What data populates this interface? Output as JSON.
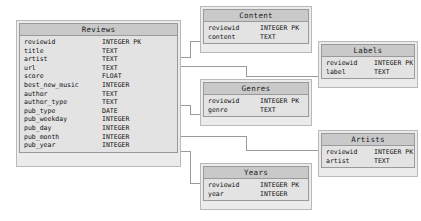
{
  "diagram": {
    "type": "entity-relationship-diagram",
    "background_color": "#ffffff",
    "entity_header_color": "#c9c9c9",
    "entity_body_color": "#e3e3e3",
    "entity_border_color": "#9a9a9a",
    "connector_color": "#9a9a9a"
  },
  "entities": [
    {
      "id": "reviews",
      "name": "Reviews",
      "fields": [
        {
          "name": "reviewid",
          "type": "INTEGER PK"
        },
        {
          "name": "title",
          "type": "TEXT"
        },
        {
          "name": "artist",
          "type": "TEXT"
        },
        {
          "name": "url",
          "type": "TEXT"
        },
        {
          "name": "score",
          "type": "FLOAT"
        },
        {
          "name": "best_new_music",
          "type": "INTEGER"
        },
        {
          "name": "author",
          "type": "TEXT"
        },
        {
          "name": "author_type",
          "type": "TEXT"
        },
        {
          "name": "pub_type",
          "type": "DATE"
        },
        {
          "name": "pub_weekday",
          "type": "INTEGER"
        },
        {
          "name": "pub_day",
          "type": "INTEGER"
        },
        {
          "name": "pub_month",
          "type": "INTEGER"
        },
        {
          "name": "pub_year",
          "type": "INTEGER"
        }
      ]
    },
    {
      "id": "content",
      "name": "Content",
      "fields": [
        {
          "name": "reviewid",
          "type": "INTEGER PK"
        },
        {
          "name": "content",
          "type": "TEXT"
        }
      ]
    },
    {
      "id": "labels",
      "name": "Labels",
      "fields": [
        {
          "name": "reviewid",
          "type": "INTEGER PK"
        },
        {
          "name": "label",
          "type": "TEXT"
        }
      ]
    },
    {
      "id": "genres",
      "name": "Genres",
      "fields": [
        {
          "name": "reviewid",
          "type": "INTEGER PK"
        },
        {
          "name": "genre",
          "type": "TEXT"
        }
      ]
    },
    {
      "id": "artists",
      "name": "Artists",
      "fields": [
        {
          "name": "reviewid",
          "type": "INTEGER PK"
        },
        {
          "name": "artist",
          "type": "TEXT"
        }
      ]
    },
    {
      "id": "years",
      "name": "Years",
      "fields": [
        {
          "name": "reviewid",
          "type": "INTEGER PK"
        },
        {
          "name": "year",
          "type": "INTEGER"
        }
      ]
    }
  ],
  "relationships": [
    {
      "from": "reviews",
      "to": "content",
      "from_field": "reviewid",
      "to_field": "reviewid"
    },
    {
      "from": "reviews",
      "to": "labels",
      "from_field": "reviewid",
      "to_field": "reviewid"
    },
    {
      "from": "reviews",
      "to": "genres",
      "from_field": "reviewid",
      "to_field": "reviewid"
    },
    {
      "from": "reviews",
      "to": "artists",
      "from_field": "reviewid",
      "to_field": "reviewid"
    },
    {
      "from": "reviews",
      "to": "years",
      "from_field": "reviewid",
      "to_field": "reviewid"
    }
  ]
}
